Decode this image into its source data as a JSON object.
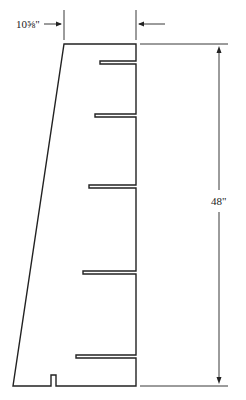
{
  "diagram": {
    "type": "technical-drawing",
    "dimensions": {
      "top_width_label": "10⅝\"",
      "height_label": "48\""
    },
    "slot_count": 5,
    "notch_count": 1,
    "line_color": "#222222",
    "background_color": "#ffffff"
  }
}
